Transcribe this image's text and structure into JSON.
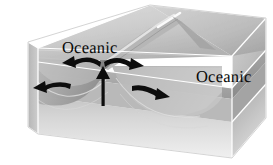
{
  "figure": {
    "kind": "block-diagram",
    "width": 273,
    "height": 165,
    "background_color": "#ffffff"
  },
  "labels": {
    "left_plate": "Oceanic",
    "right_plate": "Oceanic"
  },
  "palette": {
    "background": "#ffffff",
    "top_surface_light": "#d8d8d8",
    "top_surface_mid": "#c2c2c2",
    "top_surface_dark": "#9e9e9e",
    "ridge_highlight": "#f2f2f2",
    "crust_band_upper": "#b4b4b4",
    "crust_band_mid": "#8e8e8e",
    "crust_band_lower": "#a8a8a8",
    "mantle_upper": "#cfcfcf",
    "mantle_lower": "#ededed",
    "side_face_dark": "#9a9a9a",
    "side_face_mid": "#b0b0b0",
    "edge_line": "#ffffff",
    "outline": "#bfbfbf",
    "arrow": "#101010",
    "text": "#0a0a0a"
  },
  "geology": {
    "boundary_type": "divergent",
    "feature": "mid-ocean ridge",
    "plates": [
      {
        "name": "Oceanic",
        "side": "left",
        "motion": "away from ridge axis"
      },
      {
        "name": "Oceanic",
        "side": "right",
        "motion": "away from ridge axis"
      }
    ],
    "layers": [
      {
        "name": "seafloor-top-surface"
      },
      {
        "name": "oceanic-crust-band"
      },
      {
        "name": "lithospheric-mantle-band"
      },
      {
        "name": "asthenosphere-block"
      }
    ]
  },
  "arrows": [
    {
      "id": "arrow-spread-left-inner",
      "direction": "left",
      "meaning": "plate moves left away from ridge"
    },
    {
      "id": "arrow-spread-right-inner",
      "direction": "right",
      "meaning": "plate moves right away from ridge"
    },
    {
      "id": "arrow-spread-left-outer",
      "direction": "left",
      "meaning": "left plate drift"
    },
    {
      "id": "arrow-spread-right-outer",
      "direction": "right",
      "meaning": "right plate drift"
    },
    {
      "id": "arrow-upwelling",
      "direction": "up",
      "meaning": "magma rises beneath ridge axis"
    }
  ]
}
